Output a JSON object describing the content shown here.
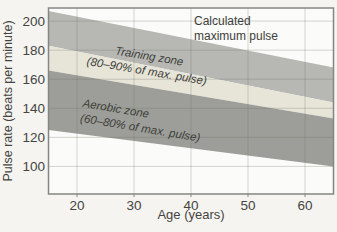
{
  "chart_data": {
    "type": "area",
    "title": "",
    "xlabel": "Age (years)",
    "ylabel": "Pulse rate (beats per minute)",
    "x_ticks": [
      20,
      30,
      40,
      50,
      60
    ],
    "y_ticks": [
      100,
      120,
      140,
      160,
      180,
      200
    ],
    "xlim": [
      15,
      65
    ],
    "ylim": [
      81,
      209
    ],
    "grid": true,
    "bands": [
      {
        "name": "calculated-maximum-pulse-band",
        "label": "Calculated maximum pulse",
        "x": [
          15,
          65
        ],
        "top": [
          207,
          168
        ],
        "bottom": [
          183,
          144
        ],
        "color": "#b7b8b4"
      },
      {
        "name": "training-zone-band",
        "label": "Training zone (80–90% of max. pulse)",
        "x": [
          15,
          65
        ],
        "top": [
          183,
          144
        ],
        "bottom": [
          166,
          133
        ],
        "color": "#e7e4d8"
      },
      {
        "name": "aerobic-zone-band",
        "label": "Aerobic zone (60–80% of max. pulse)",
        "x": [
          15,
          65
        ],
        "top": [
          166,
          133
        ],
        "bottom": [
          125,
          100
        ],
        "color": "#9d9e99"
      }
    ]
  },
  "annotations": {
    "calc_max": "Calculated\nmaximum pulse",
    "training": "Training zone\n(80–90% of max. pulse)",
    "aerobic": "Aerobic zone\n(60–80% of max. pulse)"
  },
  "colors": {
    "page_bg": "#f5f4f1",
    "plot_bg": "#fbfbf9",
    "grid": "#6a6a62",
    "border": "#858682",
    "tick_text": "#45453f",
    "annotation_text": "#3d3e3a"
  }
}
